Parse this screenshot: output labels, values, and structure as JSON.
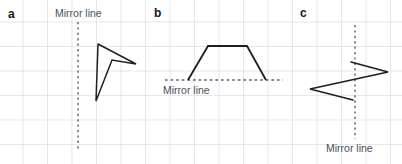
{
  "worksheet": {
    "background": "#ffffff",
    "grid_color": "#cdd4de",
    "stroke_color": "#1d1f23",
    "mirror_line_color": "#5a6068",
    "label_color": "#4a4f57",
    "letter_color": "#16181c"
  },
  "panels": [
    {
      "letter": "a",
      "mirror_label": "Mirror line",
      "mirror_orientation": "vertical",
      "mirror_line": {
        "x1": 78,
        "y1": 22,
        "x2": 78,
        "y2": 149
      },
      "shape_name": "concave-dart",
      "shape_points": "98,44 136,64 112,60 96,101"
    },
    {
      "letter": "b",
      "mirror_label": "Mirror line",
      "mirror_orientation": "horizontal",
      "mirror_line": {
        "x1": 165,
        "y1": 80,
        "x2": 283,
        "y2": 80
      },
      "shape_name": "trapezium",
      "shape_points": "188,80 208,46 247,46 266,80"
    },
    {
      "letter": "c",
      "mirror_label": "Mirror line",
      "mirror_orientation": "vertical",
      "mirror_line": {
        "x1": 355,
        "y1": 25,
        "x2": 355,
        "y2": 139
      },
      "shape_name": "zigzag-arrow",
      "shape_points": "351,62 388,72 310,89 353,100"
    }
  ]
}
